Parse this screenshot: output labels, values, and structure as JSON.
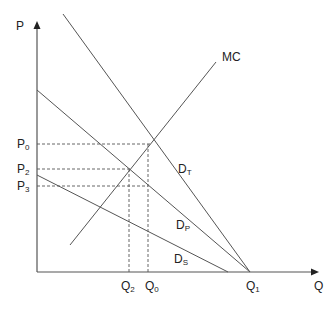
{
  "diagram": {
    "axes": {
      "y_label": "P",
      "x_label": "Q"
    },
    "curves": [
      {
        "id": "MC",
        "label_main": "MC",
        "label_sub": ""
      },
      {
        "id": "DT",
        "label_main": "D",
        "label_sub": "T"
      },
      {
        "id": "DP",
        "label_main": "D",
        "label_sub": "P"
      },
      {
        "id": "DS",
        "label_main": "D",
        "label_sub": "S"
      }
    ],
    "price_levels": [
      {
        "main": "P",
        "sub": "0"
      },
      {
        "main": "P",
        "sub": "2"
      },
      {
        "main": "P",
        "sub": "3"
      }
    ],
    "quantity_levels": [
      {
        "main": "Q",
        "sub": "2"
      },
      {
        "main": "Q",
        "sub": "0"
      },
      {
        "main": "Q",
        "sub": "1"
      }
    ],
    "colors": {
      "line": "#555555",
      "text": "#222222"
    }
  }
}
